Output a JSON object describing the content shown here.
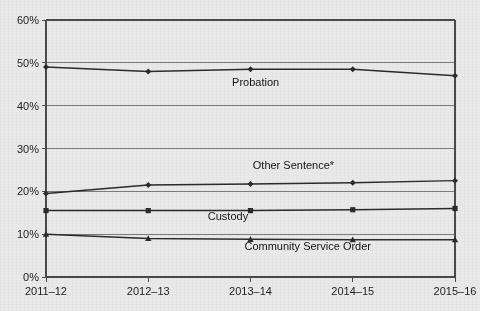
{
  "chart_data": {
    "type": "line",
    "title": "",
    "xlabel": "",
    "ylabel": "",
    "categories": [
      "2011–12",
      "2012–13",
      "2013–14",
      "2014–15",
      "2015–16"
    ],
    "ylim": [
      0,
      60
    ],
    "yticks": [
      0,
      10,
      20,
      30,
      40,
      50,
      60
    ],
    "ytick_labels": [
      "0%",
      "10%",
      "20%",
      "30%",
      "40%",
      "50%",
      "60%"
    ],
    "grid": true,
    "grid_axis": "y",
    "legend": "inline-labels",
    "series": [
      {
        "name": "Probation",
        "marker": "diamond",
        "color": "#2b2b2b",
        "values": [
          49.0,
          48.0,
          48.5,
          48.5,
          47.0
        ]
      },
      {
        "name": "Other Sentence*",
        "marker": "diamond",
        "color": "#2b2b2b",
        "values": [
          19.5,
          21.5,
          21.7,
          22.0,
          22.5
        ]
      },
      {
        "name": "Custody",
        "marker": "square",
        "color": "#2b2b2b",
        "values": [
          15.5,
          15.5,
          15.5,
          15.7,
          16.0
        ]
      },
      {
        "name": "Community Service Order",
        "marker": "triangle",
        "color": "#2b2b2b",
        "values": [
          10.0,
          9.0,
          8.8,
          8.7,
          8.7
        ]
      }
    ],
    "annotations": [
      {
        "text": "Probation",
        "x": 2.05,
        "y": 44.6
      },
      {
        "text": "Other Sentence*",
        "x": 2.42,
        "y": 25.2
      },
      {
        "text": "Custody",
        "x": 1.78,
        "y": 13.2
      },
      {
        "text": "Community Service Order",
        "x": 2.56,
        "y": 6.2
      }
    ]
  },
  "colors": {
    "background": "#e9e9e9",
    "plot_background": "#e9e9e9",
    "axis": "#4a4a4a",
    "grid": "#6f6f6f",
    "series": "#2b2b2b",
    "text": "#1d1d1d"
  }
}
